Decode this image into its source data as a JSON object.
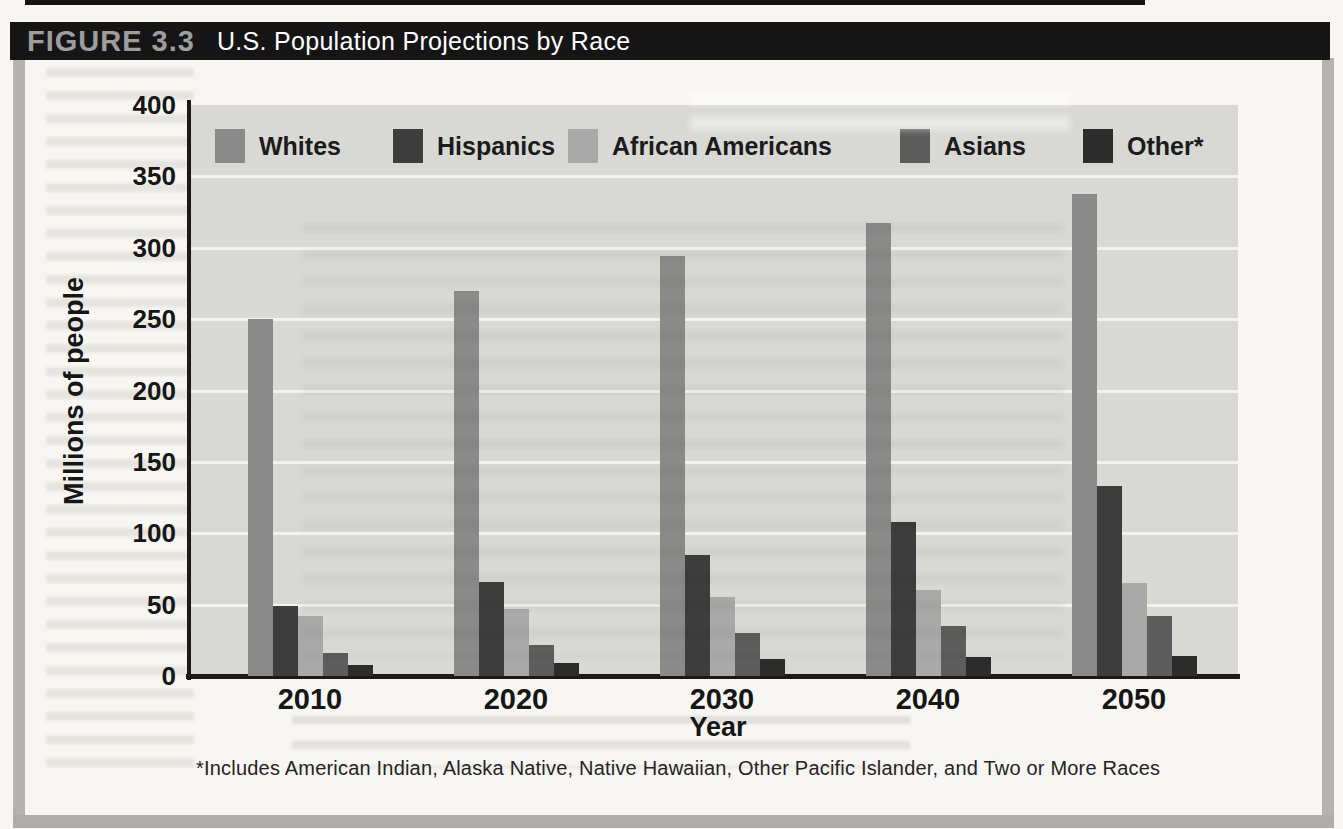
{
  "figure": {
    "label": "FIGURE 3.3",
    "title": "U.S. Population Projections by Race",
    "footnote": "*Includes American Indian, Alaska Native, Native Hawaiian, Other Pacific Islander, and Two or More Races"
  },
  "chart_data": {
    "type": "bar",
    "title": "U.S. Population Projections by Race",
    "xlabel": "Year",
    "ylabel": "Millions of people",
    "ylim": [
      0,
      400
    ],
    "yticks": [
      0,
      50,
      100,
      150,
      200,
      250,
      300,
      350,
      400
    ],
    "grid": true,
    "legend_position": "top-inside",
    "categories": [
      "2010",
      "2020",
      "2030",
      "2040",
      "2050"
    ],
    "series": [
      {
        "name": "Whites",
        "color": "#8a8a8a",
        "values": [
          250,
          270,
          294,
          317,
          338
        ]
      },
      {
        "name": "Hispanics",
        "color": "#3d3d3d",
        "values": [
          49,
          66,
          85,
          108,
          133
        ]
      },
      {
        "name": "African Americans",
        "color": "#a9a9a9",
        "values": [
          42,
          47,
          55,
          60,
          65
        ]
      },
      {
        "name": "Asians",
        "color": "#5d5d5d",
        "values": [
          16,
          22,
          30,
          35,
          42
        ]
      },
      {
        "name": "Other*",
        "color": "#2c2c2c",
        "values": [
          8,
          9,
          12,
          13,
          14
        ]
      }
    ]
  },
  "colors": {
    "title_bar_bg": "#151515",
    "figure_label_text": "#9d9d9d",
    "figure_title_text": "#ffffff",
    "page_background": "#f7f6f2",
    "plot_background": "#d8d8d5",
    "gridline": "#f4f3ee",
    "axis": "#1a1a1a",
    "frame_border": "#b4b3af"
  }
}
